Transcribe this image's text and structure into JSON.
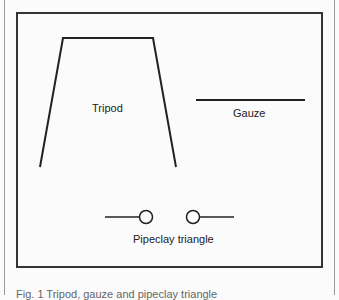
{
  "diagram": {
    "labels": {
      "tripod": "Tripod",
      "gauze": "Gauze",
      "pipeclay_triangle": "Pipeclay triangle"
    },
    "caption": "Fig. 1  Tripod, gauze and pipeclay triangle"
  }
}
